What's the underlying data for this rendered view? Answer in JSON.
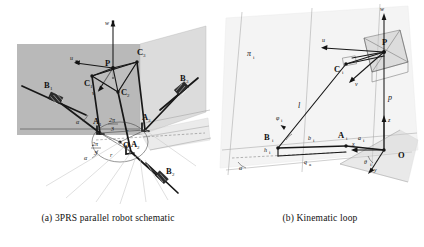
{
  "figure": {
    "domain": "Diagram",
    "kind": "two-panel mechanism schematic",
    "panel_a": {
      "caption": "(a) 3PRS parallel robot schematic",
      "labels": {
        "platform_center": "P",
        "spherical_joints": [
          "C",
          "C",
          "C"
        ],
        "spherical_joint_subs": [
          "1",
          "2",
          "3"
        ],
        "revolute_joints": [
          "A",
          "A",
          "A"
        ],
        "revolute_joint_subs": [
          "1",
          "2",
          "3"
        ],
        "prismatic_joints": [
          "B",
          "B",
          "B"
        ],
        "prismatic_joint_subs": [
          "1",
          "2",
          "3"
        ],
        "origin": "O",
        "axis_u": "u",
        "axis_v": "v",
        "axis_w": "w",
        "angle_num": "2π",
        "angle_den": "3",
        "angle_num_2": "2π",
        "angle_den_2": "3",
        "radius_1": "r",
        "radius_2": "r",
        "alpha_1": "α",
        "alpha_2": "α"
      }
    },
    "panel_b": {
      "caption": "(b) Kinematic loop",
      "labels": {
        "plane": "π",
        "plane_sub": "i",
        "platform_center": "P",
        "spherical_joint": "C",
        "spherical_joint_sub": "i",
        "revolute_joint": "A",
        "revolute_joint_sub": "i",
        "prismatic_joint": "B",
        "prismatic_joint_sub": "i",
        "origin": "O",
        "axis_u": "u",
        "axis_v": "v",
        "axis_w": "w",
        "axis_x": "x",
        "axis_y": "y",
        "axis_z": "z",
        "leg_length": "l",
        "platform_vector": "p",
        "link_b": "b",
        "link_b_sub": "i",
        "link_a": "a",
        "link_a_sub": "i",
        "actuator": "q",
        "actuator_sub": "a",
        "height": "h",
        "height_sub": "i",
        "angle_phi": "φ",
        "angle_phi_sub": "i",
        "angle_theta": "θ",
        "angle_theta_sub": "i",
        "angle_alpha": "α"
      }
    }
  },
  "colors": {
    "ink": "#171717",
    "plane_dark": "#b9b9b9",
    "plane_light": "#dcdcdc",
    "platform_fill": "#c6c6c6",
    "guide": "#9f9f9f",
    "ray": "#c9c9c9",
    "background": "#ffffff"
  }
}
